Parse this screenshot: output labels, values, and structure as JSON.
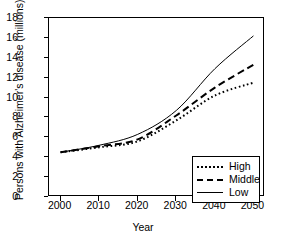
{
  "chart_data": {
    "type": "line",
    "title": "",
    "xlabel": "Year",
    "ylabel": "Persons with Alzheimer's disease (millions)",
    "x": [
      2000,
      2010,
      2020,
      2030,
      2040,
      2050
    ],
    "xticklabels": [
      "2000",
      "2010",
      "2020",
      "2030",
      "2040",
      "2050"
    ],
    "yticklabels": [
      "0",
      "2",
      "4",
      "6",
      "8",
      "10",
      "12",
      "14",
      "16",
      "18"
    ],
    "yticks": [
      0,
      2,
      4,
      6,
      8,
      10,
      12,
      14,
      16,
      18
    ],
    "xlim": [
      1997,
      2053
    ],
    "ylim": [
      0,
      18
    ],
    "grid": false,
    "legend_position": "lower right",
    "series": [
      {
        "name": "High",
        "style": "dotted",
        "color": "#000000",
        "values": [
          4.5,
          5.0,
          5.6,
          7.7,
          10.2,
          11.5
        ]
      },
      {
        "name": "Middle",
        "style": "dashed",
        "color": "#000000",
        "values": [
          4.5,
          5.1,
          5.8,
          8.2,
          11.0,
          13.3
        ]
      },
      {
        "name": "Low",
        "style": "solid",
        "color": "#000000",
        "values": [
          4.5,
          5.2,
          6.3,
          8.7,
          12.9,
          16.2
        ]
      }
    ]
  },
  "legend": {
    "entries": [
      {
        "label": "High"
      },
      {
        "label": "Middle"
      },
      {
        "label": "Low"
      }
    ]
  },
  "axes": {
    "x_title": "Year",
    "y_title": "Persons with Alzheimer's disease (millions)"
  }
}
